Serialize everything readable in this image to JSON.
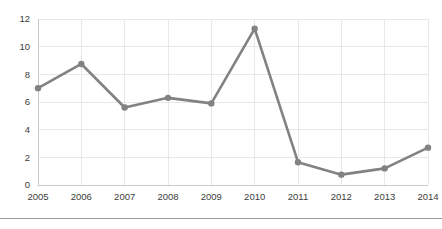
{
  "chart_data": {
    "type": "line",
    "title": "",
    "subtitle": "",
    "xlabel": "",
    "ylabel": "",
    "categories": [
      "2005",
      "2006",
      "2007",
      "2008",
      "2009",
      "2010",
      "2011",
      "2012",
      "2013",
      "2014"
    ],
    "values": [
      7.0,
      8.75,
      5.6,
      6.3,
      5.9,
      11.3,
      1.65,
      0.75,
      1.2,
      2.7
    ],
    "series": [
      {
        "name": "",
        "values": [
          7.0,
          8.75,
          5.6,
          6.3,
          5.9,
          11.3,
          1.65,
          0.75,
          1.2,
          2.7
        ]
      }
    ],
    "ylim": [
      0,
      12
    ],
    "y_ticks": [
      0,
      2,
      4,
      6,
      8,
      10,
      12
    ],
    "y_tick_labels": [
      "0",
      "2",
      "4",
      "6",
      "8",
      "10",
      "12"
    ],
    "x_tick_labels": [
      "2005",
      "2006",
      "2007",
      "2008",
      "2009",
      "2010",
      "2011",
      "2012",
      "2013",
      "2014"
    ],
    "grid": true,
    "grid_axis": "both",
    "legend": false,
    "legend_position": "none",
    "markers": true,
    "annotations": []
  },
  "style": {
    "line_color": "#828282",
    "marker_color": "#828282",
    "grid_color": "#e8e8e8",
    "axis_color": "#c9c9c9",
    "tick_label_color": "#3c3c3c",
    "background_color": "#ffffff",
    "divider_color": "#9a9a9a"
  },
  "axes": {
    "y_axis_name": "y-axis",
    "x_axis_name": "x-axis"
  }
}
